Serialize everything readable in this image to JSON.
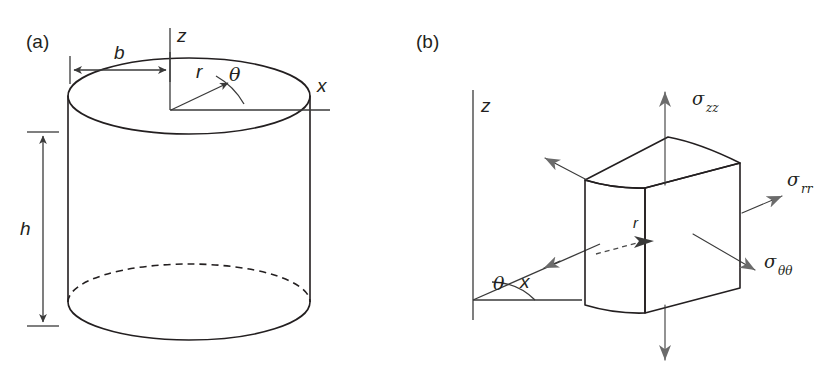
{
  "figure": {
    "width": 834,
    "height": 378,
    "background": "#ffffff",
    "stroke_color": "#231f20",
    "body_fill": "#d4d4d4",
    "cube_top_fill": "#d0d0d0",
    "cube_front_fill": "#cccccc",
    "cube_side_fill": "#c4c4c4",
    "arrow_color": "#6b6b6b"
  },
  "panel_a": {
    "label": "(a)",
    "caption_position": "top-left",
    "shape": "cylinder",
    "axes": [
      {
        "name": "z-axis",
        "label": "z",
        "direction": "up"
      },
      {
        "name": "x-axis",
        "label": "x",
        "direction": "right"
      }
    ],
    "dimensions": [
      {
        "name": "radius",
        "label": "b",
        "orientation": "horizontal",
        "note": "from cylinder left edge to z-axis"
      },
      {
        "name": "height",
        "label": "h",
        "orientation": "vertical",
        "note": "from top face to bottom face"
      }
    ],
    "polar_coords": [
      {
        "name": "radial",
        "label": "r",
        "note": "arrow from origin up-right on top face"
      },
      {
        "name": "angular",
        "label": "θ",
        "note": "arc between r and x-axis"
      }
    ],
    "hidden_edge": "dashed back arc of bottom ellipse"
  },
  "panel_b": {
    "label": "(b)",
    "caption_position": "top-left",
    "shape": "curvilinear volume element",
    "axes": [
      {
        "name": "z-axis",
        "label": "z",
        "direction": "up"
      },
      {
        "name": "x-axis",
        "label": "x",
        "direction": "right"
      }
    ],
    "polar_coords": [
      {
        "name": "radial",
        "label": "r",
        "note": "dashed arrow into element center"
      },
      {
        "name": "angular",
        "label": "θ",
        "note": "arc between x-axis and r-direction line"
      }
    ],
    "stresses": [
      {
        "name": "axial-stress",
        "symbol": "σ",
        "subscript": "zz",
        "direction": "up",
        "labeled": true
      },
      {
        "name": "axial-stress-opposite",
        "symbol": "σ",
        "subscript": "zz",
        "direction": "down",
        "labeled": false
      },
      {
        "name": "radial-stress",
        "symbol": "σ",
        "subscript": "rr",
        "direction": "right",
        "labeled": true
      },
      {
        "name": "hoop-stress",
        "symbol": "σ",
        "subscript": "θθ",
        "direction": "down-right",
        "labeled": true
      },
      {
        "name": "hoop-stress-opposite",
        "symbol": "σ",
        "subscript": "θθ",
        "direction": "up-left",
        "labeled": false
      }
    ]
  }
}
